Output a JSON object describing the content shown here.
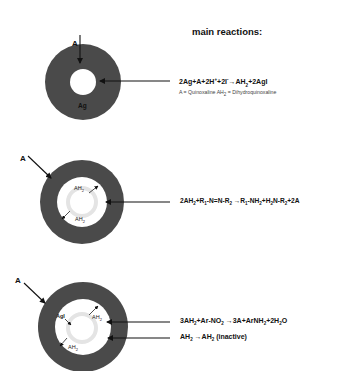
{
  "title": "main reactions:",
  "panels": [
    {
      "id": "panel-1",
      "entry_label": "A",
      "core_label": "Ag",
      "equation": {
        "parts": [
          "2Ag+A+2H",
          "+",
          "+2I",
          "-",
          "→AH",
          "2",
          "+2AgI"
        ]
      },
      "note": {
        "parts": [
          "A = Quinoxaline AH",
          "2",
          " = Dihydroquinoxaline"
        ]
      }
    },
    {
      "id": "panel-2",
      "entry_label": "A",
      "inner_labels": [
        "AH2",
        "AH2"
      ],
      "inner_label_parts": [
        [
          "AH",
          "2"
        ],
        [
          "AH",
          "2"
        ]
      ],
      "equation": {
        "parts": [
          "2AH",
          "2",
          "+R",
          "1",
          "-N=N-R",
          "2",
          " →R",
          "1",
          "-NH",
          "2",
          "+H",
          "2",
          "N-R",
          "2",
          "+2A"
        ]
      }
    },
    {
      "id": "panel-3",
      "entry_label": "A",
      "inner_label_parts": [
        [
          "AgI",
          ""
        ],
        [
          "AH",
          "2"
        ],
        [
          "AH",
          "2"
        ]
      ],
      "equations": [
        {
          "parts": [
            "3AH",
            "2",
            "+Ar-NO",
            "2",
            " →3A+ArNH",
            "2",
            "+2H",
            "2",
            "O"
          ]
        },
        {
          "parts": [
            "AH",
            "2",
            " →AH",
            "2",
            " (inactive)"
          ]
        }
      ]
    }
  ],
  "colors": {
    "outer_ring": "#4a4a4a",
    "hole": "#ffffff",
    "inner_ring": "#e4e4e4",
    "text": "#111111"
  }
}
